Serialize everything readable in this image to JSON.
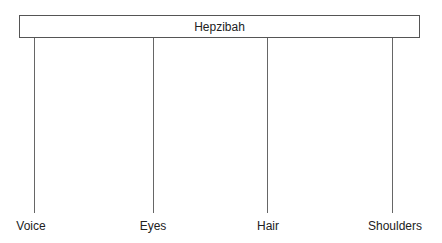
{
  "diagram": {
    "root": {
      "label": "Hepzibah"
    },
    "children": [
      {
        "label": "Voice",
        "x": 34,
        "label_x": 31
      },
      {
        "label": "Eyes",
        "x": 153,
        "label_x": 153
      },
      {
        "label": "Hair",
        "x": 267,
        "label_x": 268
      },
      {
        "label": "Shoulders",
        "x": 392,
        "label_x": 395
      }
    ]
  }
}
